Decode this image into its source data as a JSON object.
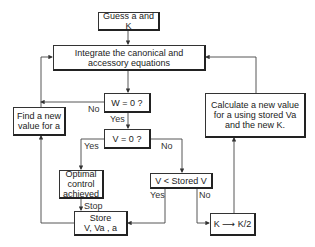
{
  "diagram": {
    "type": "flowchart",
    "nodes": {
      "guess": {
        "line1": "Guess a and K"
      },
      "integrate": {
        "line1": "Integrate the canonical and",
        "line2": "accessory equations"
      },
      "w_check": {
        "line1": "W = 0  ?"
      },
      "v_check": {
        "line1": "V = 0  ?"
      },
      "find_a": {
        "line1": "Find a new",
        "line2": "value for a"
      },
      "calculate": {
        "line1": "Calculate a new value",
        "line2": "for a using stored Va",
        "line3": "and the new K."
      },
      "optimal": {
        "line1": "Optimal",
        "line2": "control",
        "line3": "achieved"
      },
      "v_less": {
        "line1": "V < Stored V"
      },
      "store": {
        "line1": "Store",
        "line2": "V, Va , a"
      },
      "halve_k": {
        "line1": "K ⟶ K/2"
      }
    },
    "edge_labels": {
      "w_no": "No",
      "w_yes": "Yes",
      "v_yes": "Yes",
      "v_no": "No",
      "stop": "Stop",
      "vless_yes": "Yes",
      "vless_no": "No"
    },
    "edges": [
      {
        "from": "guess",
        "to": "integrate"
      },
      {
        "from": "integrate",
        "to": "w_check"
      },
      {
        "from": "w_check",
        "to": "find_a",
        "label": "No"
      },
      {
        "from": "find_a",
        "to": "integrate"
      },
      {
        "from": "w_check",
        "to": "v_check",
        "label": "Yes"
      },
      {
        "from": "v_check",
        "to": "optimal",
        "label": "Yes"
      },
      {
        "from": "v_check",
        "to": "v_less",
        "label": "No"
      },
      {
        "from": "optimal",
        "to": "store",
        "label": "Stop"
      },
      {
        "from": "v_less",
        "to": "store",
        "label": "Yes"
      },
      {
        "from": "v_less",
        "to": "halve_k",
        "label": "No"
      },
      {
        "from": "store",
        "to": "find_a"
      },
      {
        "from": "halve_k",
        "to": "calculate"
      },
      {
        "from": "calculate",
        "to": "integrate"
      }
    ]
  }
}
